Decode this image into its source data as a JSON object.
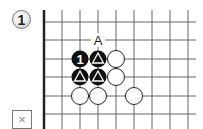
{
  "problem": {
    "number_label": "1",
    "hint_box_label": "×"
  },
  "board": {
    "label_point": {
      "text": "A",
      "col": 3,
      "row": 1
    },
    "black_stones": [
      {
        "col": 2,
        "row": 2,
        "label": "1"
      },
      {
        "col": 3,
        "row": 2,
        "label": "triangle"
      },
      {
        "col": 2,
        "row": 3,
        "label": "triangle"
      },
      {
        "col": 3,
        "row": 3,
        "label": "triangle"
      }
    ],
    "white_stones": [
      {
        "col": 4,
        "row": 2
      },
      {
        "col": 4,
        "row": 3
      },
      {
        "col": 2,
        "row": 4
      },
      {
        "col": 3,
        "row": 4
      },
      {
        "col": 5,
        "row": 4
      }
    ],
    "colors": {
      "black": "#111111",
      "white": "#ffffff",
      "line": "#666666",
      "edge": "#222222"
    }
  }
}
